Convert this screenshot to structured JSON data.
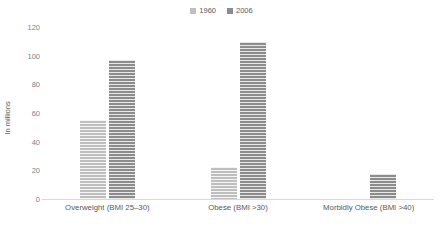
{
  "chart_data": {
    "type": "bar",
    "title": "",
    "xlabel": "",
    "ylabel": "In millions",
    "ylim": [
      0,
      120
    ],
    "yticks": [
      0,
      20,
      40,
      60,
      80,
      100,
      120
    ],
    "grid": false,
    "legend_position": "top-center",
    "categories": [
      "Overweight (BMI 25–30)",
      "Obese (BMI >30)",
      "Morbidly Obese (BMI >40)"
    ],
    "series": [
      {
        "name": "1960",
        "color": "#bfbfbf",
        "values": [
          56,
          23,
          1
        ]
      },
      {
        "name": "2006",
        "color": "#8c8c8c",
        "values": [
          98,
          110,
          18
        ]
      }
    ]
  },
  "legend": {
    "items": [
      {
        "label": "1960",
        "color": "#bfbfbf"
      },
      {
        "label": "2006",
        "color": "#8c8c8c"
      }
    ]
  },
  "axis": {
    "y_title": "In millions",
    "y_ticks": [
      "0",
      "20",
      "40",
      "60",
      "80",
      "100",
      "120"
    ]
  }
}
